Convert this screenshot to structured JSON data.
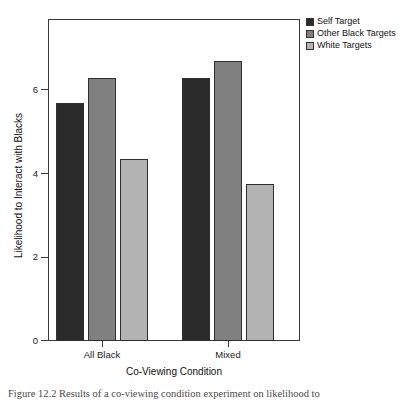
{
  "figure": {
    "caption": "Figure 12.2  Results of a co-viewing condition experiment on likelihood to"
  },
  "legend": {
    "position": "top-right",
    "items": [
      {
        "label": "Self Target",
        "color": "#2b2b2b"
      },
      {
        "label": "Other Black Targets",
        "color": "#808080"
      },
      {
        "label": "White Targets",
        "color": "#b3b3b3"
      }
    ]
  },
  "axes": {
    "y_title": "Likelihood to Interact with Blacks",
    "x_title": "Co-Viewing Condition",
    "y_ticks": [
      "0",
      "2",
      "4",
      "6"
    ],
    "x_ticks": [
      "All Black",
      "Mixed"
    ]
  },
  "chart_data": {
    "type": "bar",
    "title": "",
    "xlabel": "Co-Viewing Condition",
    "ylabel": "Likelihood to Interact with Blacks",
    "categories": [
      "All Black",
      "Mixed"
    ],
    "series": [
      {
        "name": "Self Target",
        "color": "#2b2b2b",
        "values": [
          5.7,
          6.3
        ]
      },
      {
        "name": "Other Black Targets",
        "color": "#808080",
        "values": [
          6.3,
          6.7
        ]
      },
      {
        "name": "White Targets",
        "color": "#b3b3b3",
        "values": [
          4.35,
          3.75
        ]
      }
    ],
    "ylim": [
      0,
      7.7
    ],
    "ytick_values": [
      0,
      2,
      4,
      6
    ],
    "grid": false,
    "legend_position": "top-right"
  }
}
